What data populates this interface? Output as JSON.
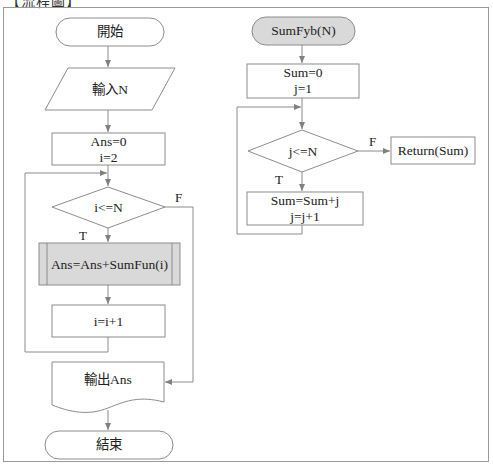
{
  "header": {
    "title": "【流程圖】"
  },
  "main_flow": {
    "start": "開始",
    "input": "輸入N",
    "init": [
      "Ans=0",
      "i=2"
    ],
    "condition": "i<=N",
    "true_label": "T",
    "false_label": "F",
    "subprocess": "Ans=Ans+SumFun(i)",
    "increment": "i=i+1",
    "output": "輸出Ans",
    "end": "結束"
  },
  "sub_flow": {
    "start": "SumFyb(N)",
    "init": [
      "Sum=0",
      "j=1"
    ],
    "condition": "j<=N",
    "true_label": "T",
    "false_label": "F",
    "body": [
      "Sum=Sum+j",
      "j=j+1"
    ],
    "return": "Return(Sum)"
  },
  "colors": {
    "stroke": "#8c8c8c",
    "subprocess_fill": "#d9d9d9",
    "sub_start_fill": "#d9d9d9",
    "frame": "#9a9a9a"
  }
}
